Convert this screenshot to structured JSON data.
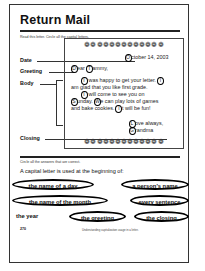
{
  "worksheet": {
    "title": "Return Mail",
    "instruction_1": "Read this letter. Circle all the capital letters.",
    "labels": {
      "date": "Date",
      "greeting": "Greeting",
      "body": "Body",
      "closing": "Closing"
    },
    "letter": {
      "flower_border": "❁❁❁❁❁❁❁❁❁❁❁❁❁",
      "date": {
        "circled": "O",
        "rest": "ctober 14, 2003"
      },
      "greeting": {
        "c1": "D",
        "mid": "ear ",
        "c2": "T",
        "rest": "ammy,"
      },
      "body_lines": [
        {
          "c1": "I",
          "t1": " was happy to get your letter. ",
          "c2": "I"
        },
        {
          "t0": "am glad that you like first grade."
        },
        {
          "c1": "I",
          "t1": " will come to see you on"
        },
        {
          "c1": "S",
          "t1": "unday. ",
          "c2": "W",
          "t2": "e can play lots of games"
        },
        {
          "t0": "and bake cookies. ",
          "c1": "I",
          "t1": "t will be fun!"
        }
      ],
      "closing": {
        "c1": "L",
        "rest1": "ove always,",
        "c2": "G",
        "rest2": "randma"
      }
    },
    "instruction_2": "Circle all the answers that are correct.",
    "question": "A capital letter is used at the beginning of:",
    "options": [
      {
        "label": "the name of a day",
        "selected": true
      },
      {
        "label": "a person's name",
        "selected": true
      },
      {
        "label": "the name of the month",
        "selected": true
      },
      {
        "label": "every sentence",
        "selected": true
      },
      {
        "label": "the year",
        "selected": false
      },
      {
        "label": "the greeting",
        "selected": true
      },
      {
        "label": "the closing",
        "selected": true
      }
    ],
    "footer": {
      "page_number": "270",
      "caption": "Understanding capitalization usage in a letter."
    }
  }
}
